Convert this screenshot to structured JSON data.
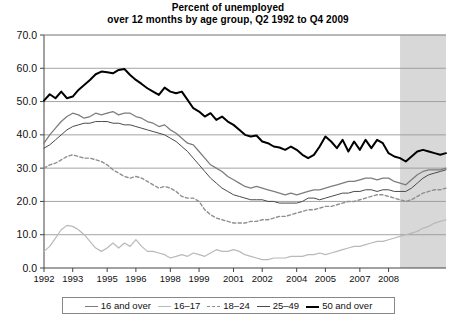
{
  "title": {
    "line1": "Percent of unemployed",
    "line2": "over 12 months by age group, Q2 1992 to Q4 2009"
  },
  "legend": {
    "items": [
      {
        "label": "16 and over",
        "color": "#7d7d7d",
        "style": "solid",
        "width": 1.3
      },
      {
        "label": "16–17",
        "color": "#b9b9b9",
        "style": "solid",
        "width": 1.2
      },
      {
        "label": "18–24",
        "color": "#8f8f8f",
        "style": "dashed",
        "width": 1.4
      },
      {
        "label": "25–49",
        "color": "#4a4a4a",
        "style": "solid",
        "width": 1.0
      },
      {
        "label": "50 and over",
        "color": "#000000",
        "style": "solid",
        "width": 2.0
      }
    ]
  },
  "shaded_region": {
    "name": "recession-band",
    "color": "#d8d8d8",
    "start_year": 2007.75,
    "end_year": 2009.75
  },
  "chart_data": {
    "type": "line",
    "title": "Percent of unemployed over 12 months by age group, Q2 1992 to Q4 2009",
    "xlabel": "",
    "ylabel": "",
    "xlim": [
      1992.25,
      2009.75
    ],
    "ylim": [
      0.0,
      70.0
    ],
    "ytick_labels": [
      "0.0",
      "10.0",
      "20.0",
      "30.0",
      "40.0",
      "50.0",
      "60.0",
      "70.0"
    ],
    "yticks": [
      0,
      10,
      20,
      30,
      40,
      50,
      60,
      70
    ],
    "xtick_labels": [
      "1992",
      "1993",
      "1995",
      "1996",
      "1998",
      "1999",
      "2001",
      "2002",
      "2004",
      "2005",
      "2007",
      "2008"
    ],
    "xticks": [
      1992.25,
      1993.5,
      1995.0,
      1996.25,
      1997.75,
      1999.0,
      2000.5,
      2001.75,
      2003.25,
      2004.5,
      2006.0,
      2007.25
    ],
    "grid": "horizontal",
    "legend_position": "bottom",
    "x": [
      1992.25,
      1992.5,
      1992.75,
      1993.0,
      1993.25,
      1993.5,
      1993.75,
      1994.0,
      1994.25,
      1994.5,
      1994.75,
      1995.0,
      1995.25,
      1995.5,
      1995.75,
      1996.0,
      1996.25,
      1996.5,
      1996.75,
      1997.0,
      1997.25,
      1997.5,
      1997.75,
      1998.0,
      1998.25,
      1998.5,
      1998.75,
      1999.0,
      1999.25,
      1999.5,
      1999.75,
      2000.0,
      2000.25,
      2000.5,
      2000.75,
      2001.0,
      2001.25,
      2001.5,
      2001.75,
      2002.0,
      2002.25,
      2002.5,
      2002.75,
      2003.0,
      2003.25,
      2003.5,
      2003.75,
      2004.0,
      2004.25,
      2004.5,
      2004.75,
      2005.0,
      2005.25,
      2005.5,
      2005.75,
      2006.0,
      2006.25,
      2006.5,
      2006.75,
      2007.0,
      2007.25,
      2007.5,
      2007.75,
      2008.0,
      2008.25,
      2008.5,
      2008.75,
      2009.0,
      2009.25,
      2009.5,
      2009.75
    ],
    "series": [
      {
        "name": "50 and over",
        "color": "#000000",
        "style": "solid",
        "width": 2.0,
        "values": [
          50.3,
          52.2,
          51.0,
          53.0,
          51.0,
          51.5,
          53.5,
          55.0,
          56.5,
          58.2,
          59.0,
          58.8,
          58.5,
          59.5,
          59.8,
          58.0,
          56.5,
          55.3,
          54.0,
          53.0,
          52.0,
          54.2,
          53.0,
          52.5,
          53.0,
          50.5,
          48.0,
          47.0,
          45.5,
          46.5,
          44.5,
          45.5,
          44.0,
          43.0,
          41.5,
          40.0,
          39.5,
          39.8,
          38.0,
          37.5,
          36.5,
          36.2,
          35.5,
          36.5,
          35.5,
          34.0,
          33.0,
          34.0,
          36.5,
          39.5,
          38.0,
          36.0,
          38.5,
          35.0,
          38.0,
          35.5,
          38.5,
          36.0,
          38.5,
          37.5,
          34.5,
          33.5,
          33.0,
          32.0,
          33.5,
          35.0,
          35.5,
          35.0,
          34.5,
          34.0,
          34.5
        ]
      },
      {
        "name": "16 and over",
        "color": "#7d7d7d",
        "style": "solid",
        "width": 1.3,
        "values": [
          37.5,
          40.0,
          42.0,
          44.0,
          45.5,
          46.5,
          46.0,
          45.0,
          45.5,
          46.5,
          46.0,
          46.5,
          47.0,
          46.0,
          46.5,
          46.5,
          45.5,
          45.0,
          44.0,
          43.5,
          42.5,
          43.0,
          41.5,
          40.5,
          39.0,
          37.5,
          37.0,
          35.0,
          33.0,
          31.0,
          30.0,
          29.0,
          27.5,
          26.5,
          25.5,
          24.5,
          24.0,
          24.5,
          24.0,
          23.5,
          23.0,
          22.5,
          22.0,
          22.5,
          22.0,
          22.5,
          23.0,
          23.5,
          23.5,
          24.0,
          24.5,
          25.0,
          25.5,
          26.0,
          26.0,
          26.5,
          27.0,
          27.0,
          26.5,
          27.0,
          27.0,
          26.0,
          25.5,
          25.0,
          26.5,
          28.0,
          29.0,
          29.5,
          29.5,
          29.5,
          30.0
        ]
      },
      {
        "name": "25–49",
        "color": "#4a4a4a",
        "style": "solid",
        "width": 1.0,
        "values": [
          36.0,
          37.0,
          38.5,
          40.0,
          41.5,
          42.5,
          43.0,
          43.5,
          43.5,
          44.0,
          44.0,
          44.0,
          43.5,
          43.5,
          43.0,
          43.0,
          42.5,
          42.0,
          41.5,
          41.0,
          40.5,
          40.0,
          39.0,
          38.0,
          36.5,
          35.0,
          33.0,
          31.0,
          29.0,
          27.0,
          25.5,
          24.0,
          23.0,
          22.0,
          21.5,
          21.0,
          20.5,
          20.5,
          20.5,
          20.0,
          20.0,
          19.5,
          19.5,
          19.5,
          19.5,
          20.0,
          21.0,
          21.0,
          20.5,
          21.0,
          21.5,
          22.0,
          22.5,
          22.5,
          23.0,
          23.0,
          23.5,
          23.5,
          23.0,
          23.5,
          23.5,
          23.0,
          23.0,
          23.0,
          24.0,
          25.5,
          27.0,
          28.0,
          28.5,
          29.0,
          29.5
        ]
      },
      {
        "name": "18–24",
        "color": "#8f8f8f",
        "style": "dashed",
        "width": 1.4,
        "values": [
          30.0,
          31.0,
          31.5,
          32.5,
          33.5,
          34.0,
          33.5,
          33.0,
          33.0,
          32.5,
          32.0,
          31.0,
          29.5,
          28.5,
          27.5,
          27.0,
          27.5,
          27.0,
          26.0,
          25.0,
          24.0,
          24.5,
          24.0,
          23.0,
          21.5,
          21.0,
          21.0,
          20.0,
          17.5,
          16.0,
          15.0,
          14.5,
          14.0,
          13.5,
          13.5,
          13.5,
          14.0,
          14.0,
          14.5,
          14.5,
          15.0,
          15.5,
          15.5,
          16.0,
          16.5,
          17.0,
          17.5,
          17.5,
          18.0,
          18.5,
          18.5,
          19.0,
          19.5,
          20.0,
          20.0,
          20.5,
          21.0,
          21.5,
          22.0,
          22.0,
          21.5,
          21.0,
          20.5,
          20.0,
          20.5,
          21.5,
          22.5,
          23.0,
          23.5,
          23.5,
          24.0
        ]
      },
      {
        "name": "16–17",
        "color": "#b9b9b9",
        "style": "solid",
        "width": 1.2,
        "values": [
          5.0,
          6.5,
          9.0,
          11.5,
          12.8,
          12.5,
          11.5,
          10.0,
          8.0,
          6.0,
          5.0,
          6.0,
          7.5,
          6.0,
          7.5,
          6.5,
          8.5,
          6.5,
          5.0,
          5.0,
          4.5,
          4.0,
          3.0,
          3.5,
          4.0,
          3.5,
          4.5,
          4.0,
          3.5,
          4.5,
          5.5,
          5.0,
          5.0,
          5.5,
          5.0,
          4.0,
          3.5,
          3.0,
          2.5,
          2.5,
          3.0,
          3.0,
          3.0,
          3.5,
          3.5,
          3.5,
          4.0,
          4.0,
          4.5,
          4.0,
          4.5,
          5.0,
          5.5,
          6.0,
          6.5,
          6.5,
          7.0,
          7.5,
          8.0,
          8.0,
          8.5,
          9.0,
          9.5,
          10.0,
          10.5,
          11.0,
          12.0,
          12.5,
          13.5,
          14.0,
          14.5
        ]
      }
    ]
  }
}
